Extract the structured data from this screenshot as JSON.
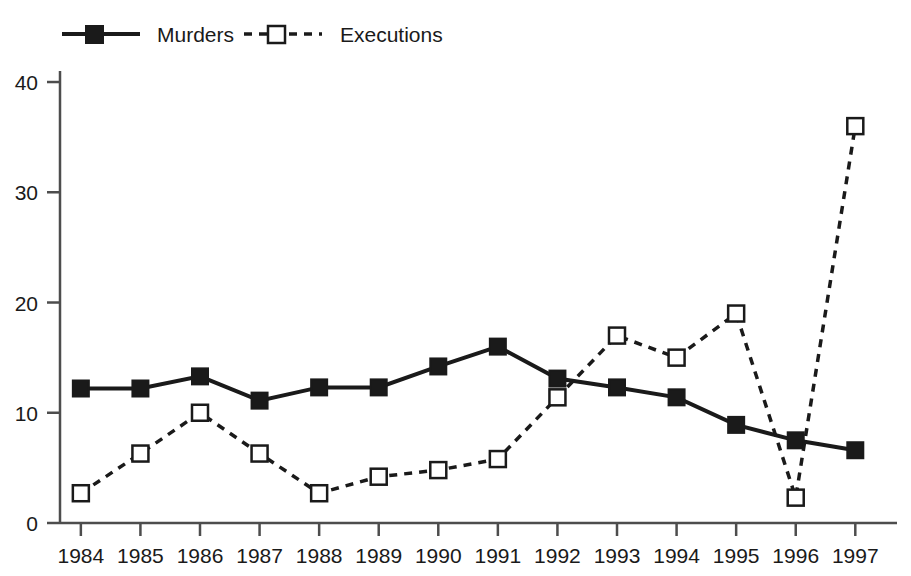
{
  "chart_data": {
    "type": "line",
    "title": "",
    "subtitle": "",
    "xlabel": "",
    "ylabel": "",
    "categories": [
      "1984",
      "1985",
      "1986",
      "1987",
      "1988",
      "1989",
      "1990",
      "1991",
      "1992",
      "1993",
      "1994",
      "1995",
      "1996",
      "1997"
    ],
    "xlim": [
      1983.65,
      1997.7
    ],
    "ylim": [
      0,
      41
    ],
    "yticks": [
      0,
      10,
      20,
      30,
      40
    ],
    "ytick_labels": [
      "0",
      "10",
      "20",
      "30",
      "40"
    ],
    "grid": false,
    "legend_position": "top-left",
    "series": [
      {
        "name": "Murders",
        "color": "#1a1a1a",
        "line_style": "solid",
        "marker": "filled-square",
        "values": [
          12.2,
          12.2,
          13.3,
          11.1,
          12.3,
          12.3,
          14.2,
          16.0,
          13.1,
          12.3,
          11.4,
          8.9,
          7.5,
          6.6
        ]
      },
      {
        "name": "Executions",
        "color": "#1a1a1a",
        "line_style": "dashed",
        "marker": "open-square",
        "values": [
          2.7,
          6.3,
          10.0,
          6.3,
          2.7,
          4.2,
          4.8,
          5.8,
          11.4,
          17.0,
          15.0,
          19.0,
          2.3,
          36.0
        ]
      }
    ]
  },
  "legend": {
    "items": [
      {
        "label": "Murders"
      },
      {
        "label": "Executions"
      }
    ]
  },
  "colors": {
    "axis": "#4d4d4d",
    "ink": "#1a1a1a",
    "background": "#ffffff"
  }
}
